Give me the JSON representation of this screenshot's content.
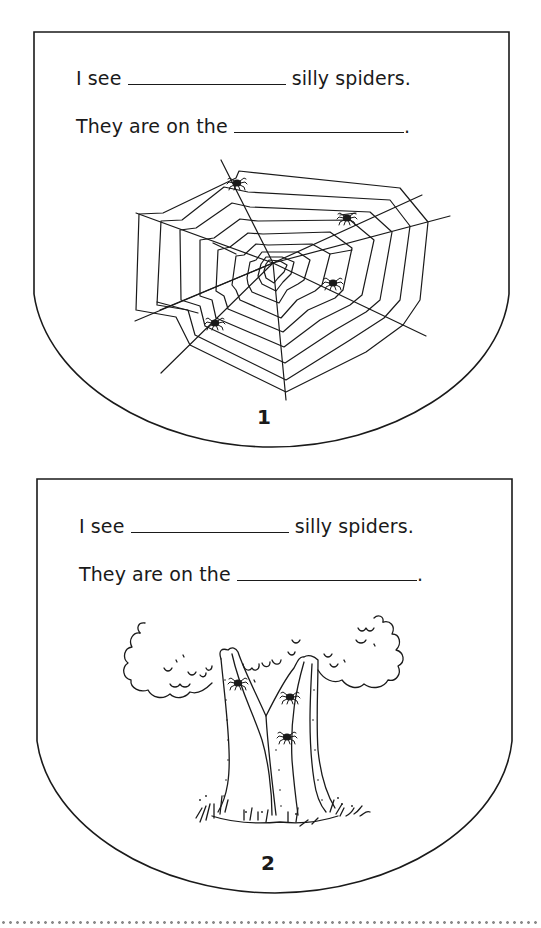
{
  "pages": [
    {
      "number": "1",
      "line1": {
        "prefix": "I see",
        "suffix": "silly spiders."
      },
      "line2": {
        "prefix": "They are on the",
        "suffix": "."
      },
      "illustration": {
        "subject": "spider-web",
        "spider_count": 4
      }
    },
    {
      "number": "2",
      "line1": {
        "prefix": "I see",
        "suffix": "silly spiders."
      },
      "line2": {
        "prefix": "They are on the",
        "suffix": "."
      },
      "illustration": {
        "subject": "tree",
        "spider_count": 3
      }
    }
  ],
  "colors": {
    "ink": "#1a1a1a",
    "cut_line": "#8a8a8a",
    "background": "#ffffff"
  }
}
